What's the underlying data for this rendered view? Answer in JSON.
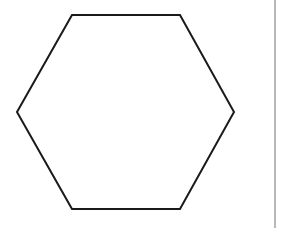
{
  "diagram": {
    "shape": "hexagon",
    "orientation": "flat-top",
    "vertices": [
      [
        72,
        15
      ],
      [
        180,
        15
      ],
      [
        234,
        112
      ],
      [
        180,
        209
      ],
      [
        72,
        209
      ],
      [
        17,
        112
      ]
    ],
    "stroke_color": "#1a1a1a",
    "stroke_width": 2,
    "fill_color": "#ffffff"
  },
  "divider": {
    "color": "#b8b8b8"
  }
}
